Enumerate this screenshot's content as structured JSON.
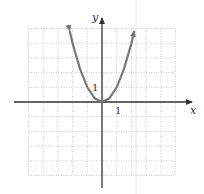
{
  "chart_data": {
    "type": "line",
    "title": "",
    "xlabel": "x",
    "ylabel": "y",
    "xlim": [
      -5,
      5
    ],
    "ylim": [
      -5,
      5
    ],
    "grid": true,
    "tick_labels": {
      "x": "1",
      "y": "1"
    },
    "series": [
      {
        "name": "y = x^2",
        "x": [
          -2.2,
          -2,
          -1.5,
          -1,
          -0.5,
          0,
          0.5,
          1,
          1.5,
          2,
          2.2
        ],
        "values": [
          4.84,
          4,
          2.25,
          1,
          0.25,
          0,
          0.25,
          1,
          2.25,
          4,
          4.84
        ],
        "color": "#777777",
        "arrows": "both-ends"
      }
    ]
  },
  "colors": {
    "axis": "#333333",
    "grid": "#bbbbbb",
    "curve": "#777777",
    "right_line": "#dddddd"
  }
}
